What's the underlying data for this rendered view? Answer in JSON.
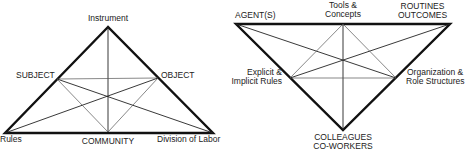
{
  "diagrams": [
    {
      "name": "activity-triangle",
      "labels": {
        "top": "Instrument",
        "left_mid": "SUBJECT",
        "right_mid": "OBJECT",
        "bottom_left": "Rules",
        "bottom_mid": "COMMUNITY",
        "bottom_right": "Division of Labor"
      }
    },
    {
      "name": "inverted-triangle",
      "labels": {
        "top_left": "AGENT(S)",
        "top_mid_1": "Tools &",
        "top_mid_2": "Concepts",
        "top_right_1": "ROUTINES",
        "top_right_2": "OUTCOMES",
        "left_mid_1": "Explicit &",
        "left_mid_2": "Implicit Rules",
        "right_mid_1": "Organization &",
        "right_mid_2": "Role Structures",
        "bottom_1": "COLLEAGUES",
        "bottom_2": "CO-WORKERS"
      }
    }
  ],
  "colors": {
    "stroke": "#111111",
    "thin": "#555555",
    "text": "#222222"
  }
}
